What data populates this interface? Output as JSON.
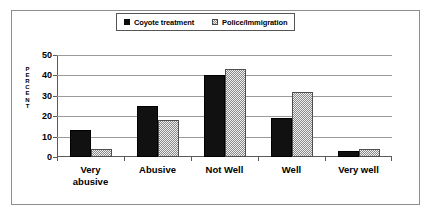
{
  "chart_data": {
    "type": "bar",
    "title": "",
    "xlabel": "",
    "ylabel": "PERCENT",
    "ylim": [
      0,
      50
    ],
    "yticks": [
      "0",
      "10",
      "20",
      "30",
      "40",
      "50"
    ],
    "grid": true,
    "legend_position": "top-center",
    "categories": [
      "Very abusive",
      "Abusive",
      "Not Well",
      "Well",
      "Very well"
    ],
    "series": [
      {
        "name": "Coyote treatment",
        "values": [
          13,
          25,
          40,
          19,
          3
        ]
      },
      {
        "name": "Police/Immigration",
        "values": [
          4,
          18,
          43,
          32,
          4
        ]
      }
    ]
  },
  "legend": {
    "items": [
      {
        "label": "Coyote treatment",
        "swatch": "dark-square-icon"
      },
      {
        "label": "Police/Immigration",
        "swatch": "hatched-square-icon"
      }
    ]
  },
  "axis": {
    "y_title_letters": [
      "P",
      "E",
      "R",
      "C",
      "E",
      "N",
      "T"
    ],
    "y_ticks": [
      "50",
      "40",
      "30",
      "20",
      "10",
      "0"
    ],
    "x_labels": [
      {
        "line1": "Very",
        "line2": "abusive"
      },
      {
        "line1": "Abusive",
        "line2": ""
      },
      {
        "line1": "Not Well",
        "line2": ""
      },
      {
        "line1": "Well",
        "line2": ""
      },
      {
        "line1": "Very well",
        "line2": ""
      }
    ]
  },
  "colors": {
    "series_1": "#111111",
    "series_2": "#8a8a8a",
    "gridline": "#9a9a9a",
    "frame": "#8d8d8d",
    "axis": "#5a5a5a"
  }
}
